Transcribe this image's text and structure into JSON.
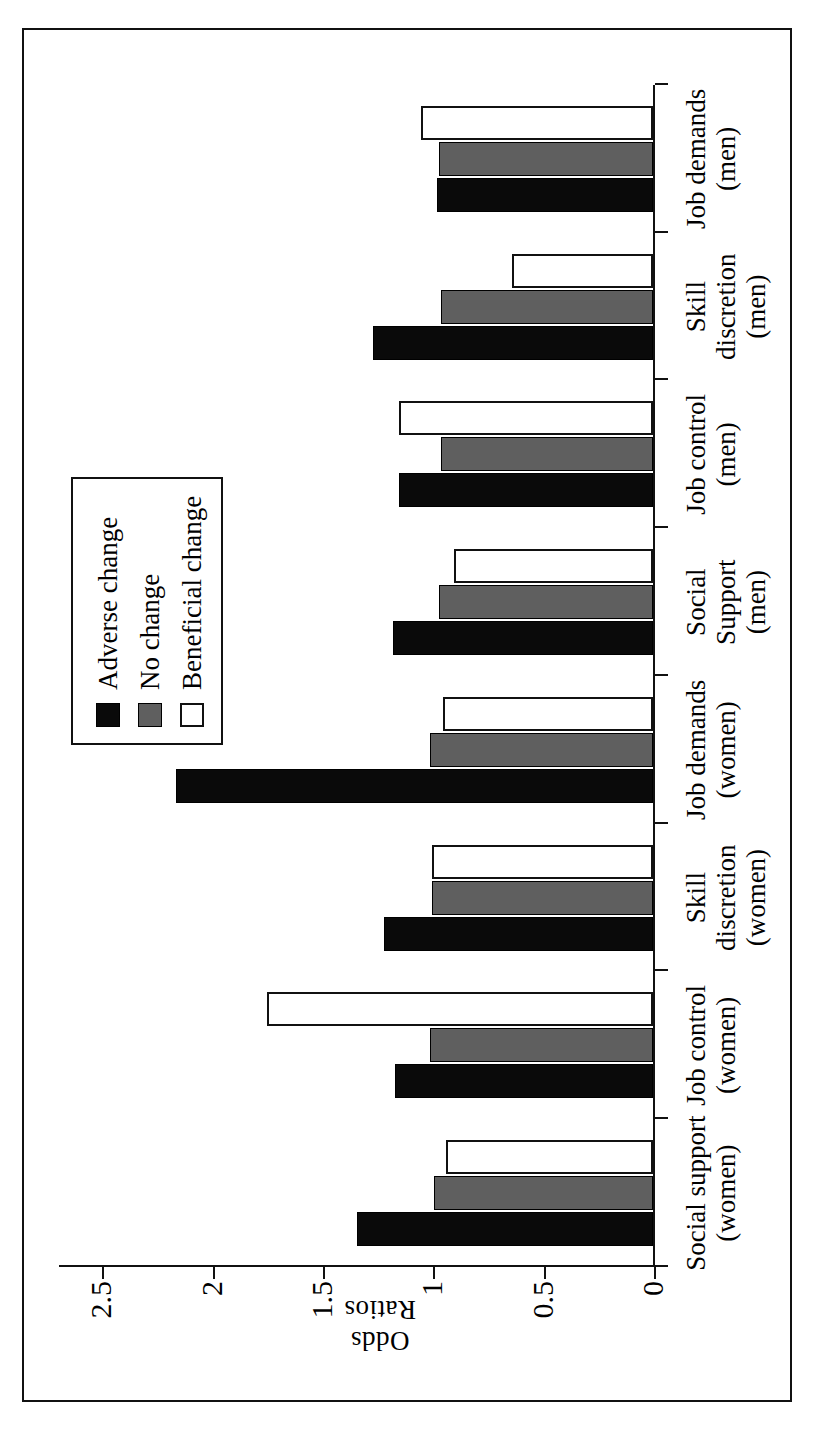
{
  "figure": {
    "axis_title": "Odds Ratios",
    "border_color": "#111111"
  },
  "legend": {
    "position": "upper-center",
    "entries": [
      {
        "label": "Adverse change",
        "color": "#0a0a0a",
        "key": "adverse"
      },
      {
        "label": "No change",
        "color": "#5f5f5f",
        "key": "nochange"
      },
      {
        "label": "Beneficial change",
        "color": "#ffffff",
        "key": "beneficial"
      }
    ]
  },
  "chart_data": {
    "type": "bar",
    "title": "",
    "xlabel": "",
    "ylabel": "Odds Ratios",
    "ylim": [
      0,
      2.7
    ],
    "yticks": [
      0,
      0.5,
      1,
      1.5,
      2,
      2.5
    ],
    "ytick_labels": [
      "0",
      "0.5",
      "1",
      "1.5",
      "2",
      "2.5"
    ],
    "grid": false,
    "orientation": "horizontal",
    "categories": [
      "Social support\n(women)",
      "Job control\n(women)",
      "Skill\ndiscretion\n(women)",
      "Job demands\n(women)",
      "Social\nSupport\n(men)",
      "Job control\n(men)",
      "Skill\ndiscretion\n(men)",
      "Job demands\n(men)"
    ],
    "series": [
      {
        "name": "Adverse change",
        "key": "adverse",
        "color": "#0a0a0a",
        "values": [
          1.34,
          1.17,
          1.22,
          2.16,
          1.18,
          1.15,
          1.27,
          0.98
        ]
      },
      {
        "name": "No change",
        "key": "nochange",
        "color": "#5f5f5f",
        "values": [
          0.99,
          1.01,
          1.0,
          1.01,
          0.97,
          0.96,
          0.96,
          0.97
        ]
      },
      {
        "name": "Beneficial change",
        "key": "beneficial",
        "color": "#ffffff",
        "values": [
          0.94,
          1.75,
          1.0,
          0.95,
          0.9,
          1.15,
          0.64,
          1.05
        ]
      }
    ]
  }
}
